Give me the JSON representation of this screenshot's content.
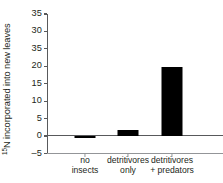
{
  "chart_data": {
    "type": "bar",
    "title": "",
    "subtitle": "",
    "xlabel": "",
    "ylabel": "15N incorporated into new leaves",
    "ylabel_superscript": "15",
    "ylabel_rest": "N incorporated into new leaves",
    "categories": [
      "no insects",
      "detritivores only",
      "detritivores + predators"
    ],
    "category_lines": [
      [
        "no",
        "insects"
      ],
      [
        "detritivores",
        "only"
      ],
      [
        "detritivores",
        "+ predators"
      ]
    ],
    "values": [
      -0.4,
      1.6,
      19.7
    ],
    "ylim": [
      -5,
      35
    ],
    "ytick_values": [
      35,
      30,
      25,
      20,
      15,
      10,
      5,
      0,
      -5
    ],
    "ytick_labels": [
      "35",
      "30",
      "35",
      "20",
      "15",
      "10",
      "5",
      "0",
      "–5"
    ],
    "grid": false,
    "legend": false,
    "bar_color": "#000000",
    "axis_color": "#58595b",
    "baseline_color": "#939598",
    "text_color": "#231f20",
    "background": "#ffffff"
  }
}
